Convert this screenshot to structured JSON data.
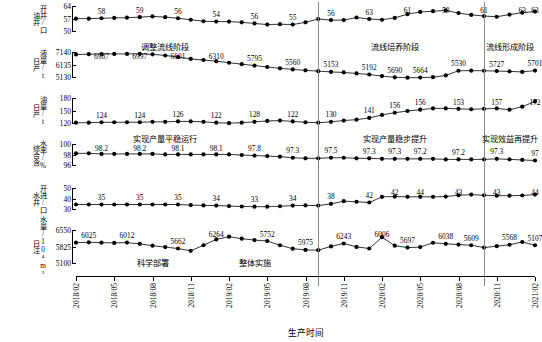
{
  "chart_data": {
    "type": "line",
    "title": "",
    "xlabel": "生产时间",
    "grid": false,
    "legend": "none",
    "x": [
      "2018/02",
      "2018/03",
      "2018/04",
      "2018/05",
      "2018/06",
      "2018/07",
      "2018/08",
      "2018/09",
      "2018/10",
      "2018/11",
      "2018/12",
      "2019/01",
      "2019/02",
      "2019/03",
      "2019/04",
      "2019/05",
      "2019/06",
      "2019/07",
      "2019/08",
      "2019/09",
      "2019/10",
      "2019/11",
      "2019/12",
      "2020/01",
      "2020/02",
      "2020/03",
      "2020/04",
      "2020/05",
      "2020/06",
      "2020/07",
      "2020/08",
      "2020/09",
      "2020/10",
      "2020/11",
      "2020/12",
      "2021/01",
      "2021/02"
    ],
    "xtick_labels": [
      "2018/02",
      "2018/05",
      "2018/08",
      "2018/11",
      "2019/02",
      "2019/05",
      "2019/08",
      "2019/11",
      "2020/02",
      "2020/05",
      "2020/08",
      "2020/11",
      "2021/02"
    ],
    "phase_dividers": [
      "2019/09",
      "2020/10"
    ],
    "phases": [
      {
        "label": "调整流线阶段",
        "center_x": "2018/09"
      },
      {
        "label": "流线培养阶段",
        "center_x": "2020/03"
      },
      {
        "label": "流线形成阶段",
        "center_x": "2020/12"
      }
    ],
    "panels": [
      {
        "name": "oil-wells-open",
        "ylabel_lines": [
          "油井",
          "开井/口"
        ],
        "yticks": [
          50,
          57,
          64
        ],
        "ylim": [
          50,
          64
        ],
        "values": [
          57.2,
          57.2,
          57.4,
          57.6,
          57.7,
          58.0,
          58.4,
          58.0,
          57.4,
          56.6,
          55.8,
          55.6,
          55.6,
          55.2,
          54.6,
          54.0,
          54.2,
          54.0,
          55.2,
          57.0,
          56.4,
          56.4,
          57.8,
          57.0,
          56.6,
          57.6,
          59.6,
          60.8,
          61.2,
          61.6,
          60.2,
          59.2,
          58.6,
          58.2,
          59.4,
          60.4,
          61.0
        ],
        "labels": [
          {
            "x": "2018/04",
            "text": "58"
          },
          {
            "x": "2018/07",
            "text": "59"
          },
          {
            "x": "2018/10",
            "text": "56"
          },
          {
            "x": "2019/01",
            "text": "54"
          },
          {
            "x": "2019/04",
            "text": "56"
          },
          {
            "x": "2019/07",
            "text": "55"
          },
          {
            "x": "2019/10",
            "text": "56"
          },
          {
            "x": "2020/01",
            "text": "63"
          },
          {
            "x": "2020/04",
            "text": "61"
          },
          {
            "x": "2020/07",
            "text": "59"
          },
          {
            "x": "2020/10",
            "text": "61"
          },
          {
            "x": "2021/01",
            "text": "63"
          },
          {
            "x": "2021/02",
            "text": "63"
          }
        ]
      },
      {
        "name": "daily-liquid-production",
        "ylabel_lines": [
          "日产",
          "液量/t"
        ],
        "yticks": [
          5130,
          6135,
          7140
        ],
        "ylim": [
          5130,
          7140
        ],
        "values": [
          6950,
          6970,
          6987,
          6990,
          6995,
          6997,
          6960,
          6870,
          6750,
          6601,
          6520,
          6430,
          6310,
          6200,
          6090,
          5980,
          5880,
          5795,
          5720,
          5660,
          5600,
          5560,
          5480,
          5400,
          5280,
          5180,
          5153,
          5160,
          5192,
          5330,
          5690,
          5700,
          5690,
          5664,
          5640,
          5600,
          5701
        ],
        "labels": [
          {
            "x": "2018/04",
            "text": "6987"
          },
          {
            "x": "2018/07",
            "text": "6997"
          },
          {
            "x": "2018/10",
            "text": "6601"
          },
          {
            "x": "2019/01",
            "text": "6310"
          },
          {
            "x": "2019/04",
            "text": "5795"
          },
          {
            "x": "2019/07",
            "text": "5560"
          },
          {
            "x": "2019/10",
            "text": "5153"
          },
          {
            "x": "2020/01",
            "text": "5192"
          },
          {
            "x": "2020/03",
            "text": "5690"
          },
          {
            "x": "2020/05",
            "text": "5664"
          },
          {
            "x": "2020/08",
            "text": "5530"
          },
          {
            "x": "2020/11",
            "text": "5727"
          },
          {
            "x": "2021/02",
            "text": "5701"
          }
        ]
      },
      {
        "name": "daily-oil-production",
        "ylabel_lines": [
          "日产",
          "油量/t"
        ],
        "yticks": [
          120,
          150,
          180
        ],
        "ylim": [
          120,
          180
        ],
        "values": [
          123,
          123,
          124,
          124,
          124,
          124,
          125,
          125,
          126,
          126,
          125,
          123,
          122,
          123,
          125,
          127,
          128,
          126,
          124,
          123,
          125,
          128,
          130,
          134,
          141,
          146,
          150,
          153,
          156,
          156,
          155,
          154,
          155,
          156,
          153,
          160,
          172
        ],
        "labels": [
          {
            "x": "2018/04",
            "text": "124"
          },
          {
            "x": "2018/07",
            "text": "124"
          },
          {
            "x": "2018/10",
            "text": "126"
          },
          {
            "x": "2019/01",
            "text": "122"
          },
          {
            "x": "2019/04",
            "text": "128"
          },
          {
            "x": "2019/07",
            "text": "122"
          },
          {
            "x": "2019/10",
            "text": "130"
          },
          {
            "x": "2020/01",
            "text": "141"
          },
          {
            "x": "2020/03",
            "text": "156"
          },
          {
            "x": "2020/05",
            "text": "156"
          },
          {
            "x": "2020/08",
            "text": "153"
          },
          {
            "x": "2020/11",
            "text": "157"
          },
          {
            "x": "2021/02",
            "text": "172"
          }
        ]
      },
      {
        "name": "comprehensive-water-cut",
        "ylabel_lines": [
          "综合含",
          "水率/%"
        ],
        "yticks": [
          96,
          98,
          100
        ],
        "ylim": [
          96,
          100
        ],
        "values": [
          98.3,
          98.3,
          98.2,
          98.2,
          98.2,
          98.2,
          98.2,
          98.1,
          98.1,
          98.1,
          98.1,
          98.1,
          98.1,
          98.0,
          97.9,
          97.8,
          97.7,
          97.5,
          97.4,
          97.4,
          97.5,
          97.5,
          97.4,
          97.4,
          97.3,
          97.3,
          97.3,
          97.3,
          97.3,
          97.2,
          97.2,
          97.2,
          97.2,
          97.3,
          97.2,
          97.1,
          97.0
        ],
        "labels": [
          {
            "x": "2018/04",
            "text": "98.2"
          },
          {
            "x": "2018/07",
            "text": "98.2"
          },
          {
            "x": "2018/10",
            "text": "98.1"
          },
          {
            "x": "2019/01",
            "text": "98.1"
          },
          {
            "x": "2019/04",
            "text": "97.8"
          },
          {
            "x": "2019/07",
            "text": "97.3"
          },
          {
            "x": "2019/10",
            "text": "97.5"
          },
          {
            "x": "2020/01",
            "text": "97.3"
          },
          {
            "x": "2020/03",
            "text": "97.3"
          },
          {
            "x": "2020/05",
            "text": "97.2"
          },
          {
            "x": "2020/08",
            "text": "97.2"
          },
          {
            "x": "2020/11",
            "text": "97.3"
          },
          {
            "x": "2021/02",
            "text": "97"
          }
        ]
      },
      {
        "name": "water-wells-open",
        "ylabel_lines": [
          "水井",
          "开进/口"
        ],
        "yticks": [
          30,
          40,
          50
        ],
        "ylim": [
          30,
          50
        ],
        "values": [
          35,
          35,
          35,
          35,
          35,
          35,
          35,
          35,
          35,
          34.5,
          34.2,
          34,
          33.6,
          33.2,
          33,
          33,
          33.4,
          34,
          34.2,
          34,
          35.6,
          38,
          37.5,
          36.8,
          42,
          42.2,
          42,
          42,
          42,
          42.2,
          43.4,
          44,
          43.4,
          43,
          43,
          43.2,
          44
        ],
        "labels": [
          {
            "x": "2018/04",
            "text": "35"
          },
          {
            "x": "2018/07",
            "text": "35"
          },
          {
            "x": "2018/10",
            "text": "35"
          },
          {
            "x": "2019/01",
            "text": "34"
          },
          {
            "x": "2019/04",
            "text": "33"
          },
          {
            "x": "2019/07",
            "text": "34"
          },
          {
            "x": "2019/10",
            "text": "38"
          },
          {
            "x": "2020/01",
            "text": "42"
          },
          {
            "x": "2020/03",
            "text": "42"
          },
          {
            "x": "2020/05",
            "text": "44"
          },
          {
            "x": "2020/08",
            "text": "43"
          },
          {
            "x": "2020/11",
            "text": "43"
          },
          {
            "x": "2021/02",
            "text": "44"
          }
        ]
      },
      {
        "name": "daily-water-injection",
        "ylabel_lines": [
          "日注",
          "水量/10⁴m³"
        ],
        "yticks": [
          5100,
          5825,
          6550
        ],
        "ylim": [
          5100,
          6550
        ],
        "values": [
          6010,
          6025,
          6010,
          6000,
          6012,
          5960,
          5880,
          5820,
          5760,
          5662,
          5900,
          6150,
          6264,
          6180,
          6120,
          6080,
          5900,
          5752,
          5700,
          5690,
          5850,
          5975,
          5830,
          5760,
          6243,
          5880,
          5800,
          5820,
          6006,
          5960,
          5930,
          5900,
          5800,
          5860,
          5920,
          6038,
          5900
        ],
        "labels": [
          {
            "x": "2018/03",
            "text": "6025"
          },
          {
            "x": "2018/06",
            "text": "6012"
          },
          {
            "x": "2018/10",
            "text": "5662"
          },
          {
            "x": "2019/01",
            "text": "6264"
          },
          {
            "x": "2019/05",
            "text": "5752"
          },
          {
            "x": "2019/08",
            "text": "5975"
          },
          {
            "x": "2019/11",
            "text": "6243"
          },
          {
            "x": "2020/02",
            "text": "6006"
          },
          {
            "x": "2020/04",
            "text": "5697"
          },
          {
            "x": "2020/07",
            "text": "6038"
          },
          {
            "x": "2020/09",
            "text": "5609"
          },
          {
            "x": "2020/12",
            "text": "5568"
          },
          {
            "x": "2021/02",
            "text": "5107"
          }
        ],
        "annotations": [
          {
            "label": "科学部署",
            "center_x": "2018/08"
          },
          {
            "label": "整体实施",
            "center_x": "2019/04"
          }
        ]
      }
    ],
    "panel_phase_texts": [
      [
        "调整流线阶段",
        "流线培养阶段",
        "流线形成阶段"
      ],
      [],
      [
        "实现产量平稳运行",
        "实现产量稳步提升",
        "实现效益再提升"
      ],
      [],
      [],
      []
    ]
  },
  "axis": {
    "xtitle": "生产时间"
  }
}
